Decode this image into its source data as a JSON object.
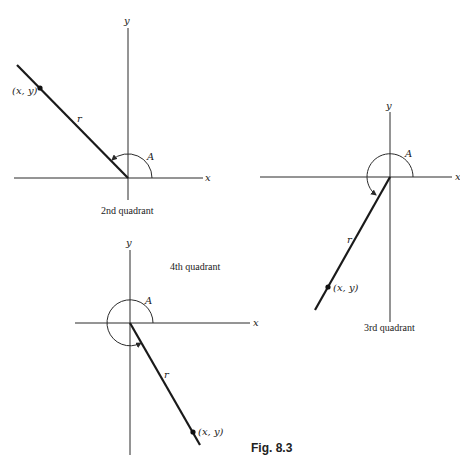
{
  "figure": {
    "caption": "Fig. 8.3",
    "diagrams": [
      {
        "id": "second-quadrant",
        "quadrant_label": "2nd quadrant",
        "x_axis_label": "x",
        "y_axis_label": "y",
        "angle_label": "A",
        "radius_label": "r",
        "point_label": "(x, y)"
      },
      {
        "id": "third-quadrant",
        "quadrant_label": "3rd quadrant",
        "x_axis_label": "x",
        "y_axis_label": "y",
        "angle_label": "A",
        "radius_label": "r",
        "point_label": "(x, y)"
      },
      {
        "id": "fourth-quadrant",
        "quadrant_label": "4th quadrant",
        "x_axis_label": "x",
        "y_axis_label": "y",
        "angle_label": "A",
        "radius_label": "r",
        "point_label": "(x, y)"
      }
    ]
  }
}
